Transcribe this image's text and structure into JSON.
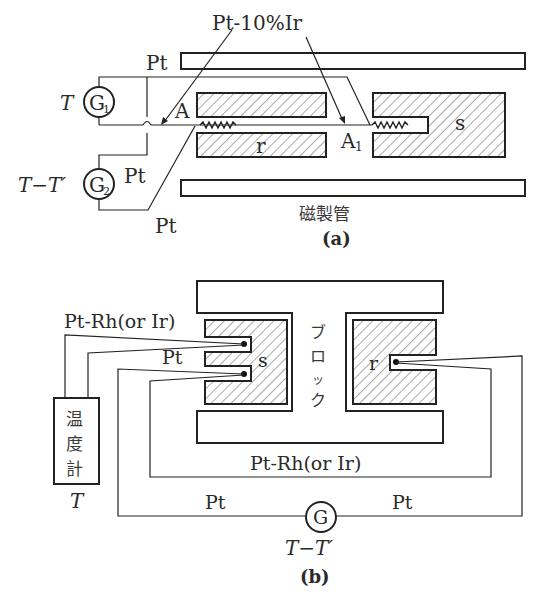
{
  "figure_a": {
    "caption": "(a)",
    "labels": {
      "wire_alloy": "Pt-10%Ir",
      "wire_pt_top": "Pt",
      "wire_pt_mid": "Pt",
      "wire_pt_bottom": "Pt",
      "junction_a": "A",
      "junction_a1": "A",
      "junction_a1_sub": "1",
      "sample_r": "r",
      "sample_s": "s",
      "tube": "磁製管"
    },
    "galvanometers": [
      {
        "id": "G1",
        "letter": "G",
        "sub": "1",
        "reading": "T"
      },
      {
        "id": "G2",
        "letter": "G",
        "sub": "2",
        "reading": "T−T′"
      }
    ]
  },
  "figure_b": {
    "caption": "(b)",
    "labels": {
      "wire_ptrh_top": "Pt-Rh(or Ir)",
      "wire_pt_upper": "Pt",
      "sample_s": "s",
      "sample_r": "r",
      "block": [
        "ブ",
        "ロ",
        "ッ",
        "ク"
      ],
      "wire_ptrh_bottom": "Pt-Rh(or Ir)",
      "wire_pt_left": "Pt",
      "wire_pt_right": "Pt"
    },
    "thermometer": {
      "chars": [
        "温",
        "度",
        "計"
      ],
      "reading": "T"
    },
    "galvanometer": {
      "letter": "G",
      "reading": "T−T′"
    }
  }
}
